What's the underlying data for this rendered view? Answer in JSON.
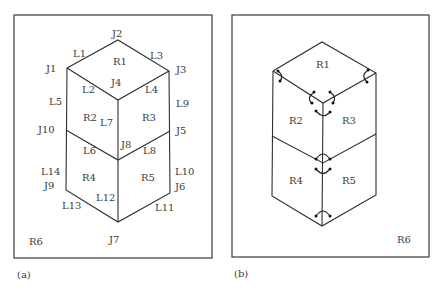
{
  "panels": [
    {
      "caption": "(a)",
      "regions": {
        "R1": "R1",
        "R2": "R2",
        "R3": "R3",
        "R4": "R4",
        "R5": "R5",
        "R6": "R6"
      },
      "junctions": {
        "J1": "J1",
        "J2": "J2",
        "J3": "J3",
        "J4": "J4",
        "J5": "J5",
        "J6": "J6",
        "J7": "J7",
        "J8": "J8",
        "J9": "J9",
        "J10": "J10"
      },
      "lines": {
        "L1": "L1",
        "L2": "L2",
        "L3": "L3",
        "L4": "L4",
        "L5": "L5",
        "L6": "L6",
        "L7": "L7",
        "L8": "L8",
        "L9": "L9",
        "L10": "L10",
        "L11": "L11",
        "L12": "L12",
        "L13": "L13",
        "L14": "L14"
      }
    },
    {
      "caption": "(b)",
      "regions": {
        "R1": "R1",
        "R2": "R2",
        "R3": "R3",
        "R4": "R4",
        "R5": "R5",
        "R6": "R6"
      },
      "marker_icon": "arc-arrow-icon"
    }
  ]
}
